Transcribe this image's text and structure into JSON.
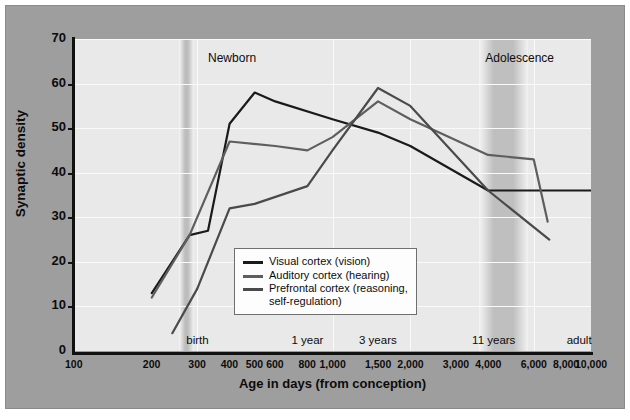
{
  "chart_data": {
    "type": "line",
    "title": "",
    "xlabel": "Age in days (from conception)",
    "ylabel": "Synaptic density",
    "xscale": "log",
    "xlim": [
      100,
      10000
    ],
    "ylim": [
      0,
      70
    ],
    "yticks": [
      0,
      10,
      20,
      30,
      40,
      50,
      60,
      70
    ],
    "xticks": [
      100,
      200,
      300,
      400,
      500,
      600,
      800,
      1000,
      1500,
      2000,
      3000,
      4000,
      6000,
      8000,
      10000
    ],
    "xtick_labels": [
      "100",
      "200",
      "300",
      "400",
      "500",
      "600",
      "800",
      "1,000",
      "1,500",
      "2,000",
      "3,000",
      "4,000",
      "6,000",
      "8,000",
      "10,000"
    ],
    "grid": true,
    "legend_position": "center",
    "series": [
      {
        "name": "Visual cortex (vision)",
        "color": "#1a1a1a",
        "x": [
          200,
          280,
          330,
          400,
          500,
          600,
          1000,
          1500,
          2000,
          4000,
          6500,
          10000
        ],
        "y": [
          13,
          26,
          27,
          51,
          58,
          56,
          52,
          49,
          46,
          36,
          36,
          36
        ]
      },
      {
        "name": "Auditory cortex (hearing)",
        "color": "#5e5e5e",
        "x": [
          200,
          280,
          400,
          600,
          800,
          1000,
          1500,
          2000,
          4000,
          6000,
          6800
        ],
        "y": [
          12,
          26,
          47,
          46,
          45,
          48,
          56,
          52,
          44,
          43,
          29
        ]
      },
      {
        "name": "Prefrontal cortex (reasoning, self-regulation)",
        "color": "#4a4a4a",
        "x": [
          240,
          300,
          400,
          500,
          800,
          1000,
          1500,
          2000,
          4000,
          6900
        ],
        "y": [
          4,
          14,
          32,
          33,
          37,
          45,
          59,
          55,
          36,
          25
        ]
      }
    ],
    "shaded_bands": [
      {
        "label": "Newborn",
        "from": 255,
        "to": 290,
        "label_x": 330
      },
      {
        "label": "Adolescence",
        "from": 3700,
        "to": 5700,
        "label_x": 3900
      }
    ],
    "period_markers": [
      {
        "label": "birth",
        "x": 300
      },
      {
        "label": "1 year",
        "x": 800
      },
      {
        "label": "3 years",
        "x": 1500
      },
      {
        "label": "11 years",
        "x": 4200
      },
      {
        "label": "adult",
        "x": 9000
      }
    ],
    "legend_entries": [
      "Visual cortex (vision)",
      "Auditory cortex (hearing)",
      "Prefrontal cortex (reasoning,",
      "self-regulation)"
    ]
  },
  "colors": {
    "frame_background": "#9e9e9e",
    "plot_background": "#e9e9e9",
    "gridline": "#fafafa",
    "band": "#bdbdbd",
    "axis": "#111111",
    "visual_cortex": "#1a1a1a",
    "auditory_cortex": "#5e5e5e",
    "prefrontal_cortex": "#4a4a4a"
  }
}
